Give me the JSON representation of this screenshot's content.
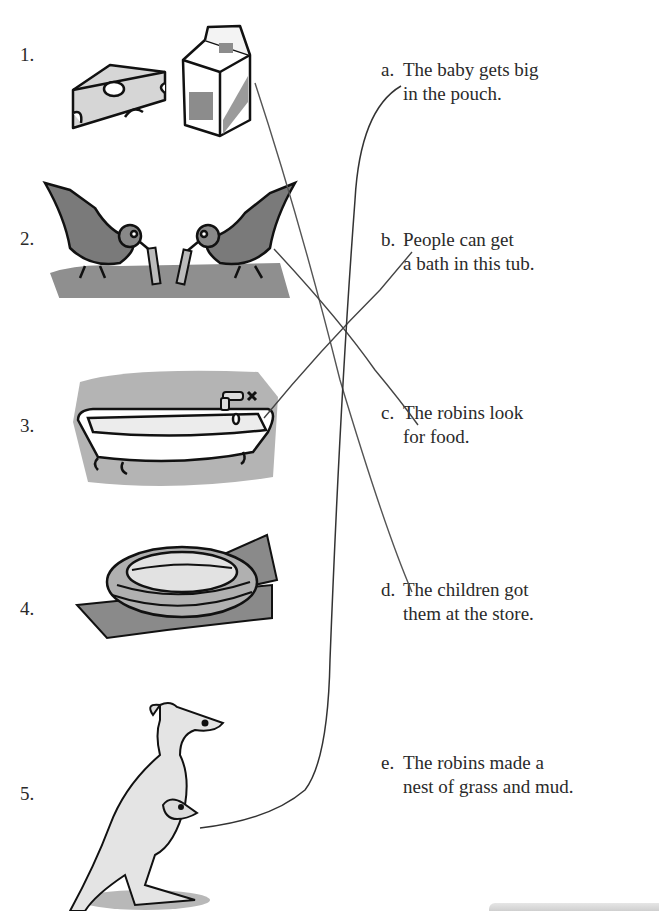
{
  "worksheet": {
    "type": "matching",
    "left_items": [
      {
        "number": "1.",
        "image": "cheese-and-milk-carton"
      },
      {
        "number": "2.",
        "image": "two-robins-eating-worms"
      },
      {
        "number": "3.",
        "image": "clawfoot-bathtub"
      },
      {
        "number": "4.",
        "image": "bird-nest-on-branch"
      },
      {
        "number": "5.",
        "image": "kangaroo-with-joey"
      }
    ],
    "right_items": [
      {
        "letter": "a.",
        "line1": "The baby gets big",
        "line2": "in the pouch."
      },
      {
        "letter": "b.",
        "line1": "People can get",
        "line2": "a bath in this tub."
      },
      {
        "letter": "c.",
        "line1": "The robins look",
        "line2": "for food."
      },
      {
        "letter": "d.",
        "line1": "The children got",
        "line2": "them at the store."
      },
      {
        "letter": "e.",
        "line1": "The robins made a",
        "line2": "nest of grass and mud."
      }
    ],
    "drawn_matches": [
      {
        "from": "1",
        "to": "d"
      },
      {
        "from": "2",
        "to": "c"
      },
      {
        "from": "3",
        "to": "b"
      },
      {
        "from": "5",
        "to": "a"
      }
    ],
    "colors": {
      "ink": "#2a2a2a",
      "line": "#555555",
      "shade": "#9a9a9a",
      "light": "#d8d8d8"
    }
  }
}
